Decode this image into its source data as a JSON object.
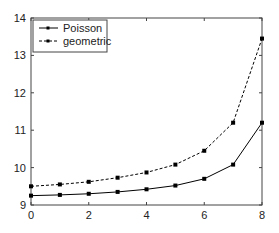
{
  "chart_data": {
    "type": "line",
    "title": "",
    "xlabel": "",
    "ylabel": "",
    "x": [
      0,
      1,
      2,
      3,
      4,
      5,
      6,
      7,
      8
    ],
    "xlim": [
      0,
      8
    ],
    "ylim": [
      9,
      14
    ],
    "xticks": [
      0,
      2,
      4,
      6,
      8
    ],
    "yticks": [
      9,
      10,
      11,
      12,
      13,
      14
    ],
    "grid": false,
    "legend_position": "upper left",
    "series": [
      {
        "name": "Poisson",
        "style": "solid",
        "marker": "square",
        "color": "#000000",
        "values": [
          9.25,
          9.27,
          9.3,
          9.35,
          9.42,
          9.52,
          9.7,
          10.08,
          11.2
        ]
      },
      {
        "name": "geometric",
        "style": "dashed",
        "marker": "square",
        "color": "#000000",
        "values": [
          9.5,
          9.55,
          9.62,
          9.73,
          9.87,
          10.08,
          10.45,
          11.2,
          13.45
        ]
      }
    ]
  },
  "legend": {
    "items": [
      "Poisson",
      "geometric"
    ]
  }
}
